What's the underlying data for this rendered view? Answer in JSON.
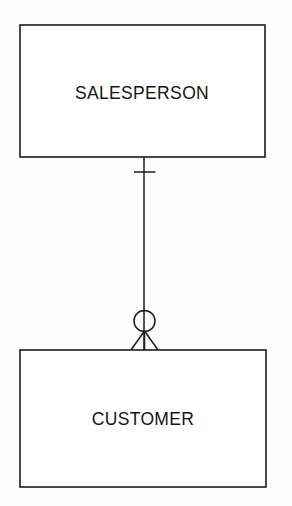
{
  "diagram": {
    "type": "entity-relationship-diagram",
    "notation": "crow's foot",
    "background_color": "#fdfdfd",
    "line_color": "#1c1c1c",
    "text_color": "#141414",
    "entities": [
      {
        "id": "salesperson",
        "label": "SALESPERSON",
        "x": 20,
        "y": 25,
        "width": 245,
        "height": 132,
        "label_x": 142,
        "label_y": 99
      },
      {
        "id": "customer",
        "label": "CUSTOMER",
        "x": 20,
        "y": 350,
        "width": 246,
        "height": 137,
        "label_x": 143,
        "label_y": 425
      }
    ],
    "relationship": {
      "id": "salesperson-customer",
      "from": "salesperson",
      "to": "customer",
      "line_x": 144,
      "line_y1": 157,
      "line_y2": 350,
      "from_cardinality": {
        "label": "one and only one",
        "symbol": "single-tick",
        "tick_y": 172,
        "tick_x1": 134,
        "tick_x2": 155
      },
      "to_cardinality": {
        "label": "zero or many",
        "symbol": "circle-crowsfoot",
        "circle_cx": 144.5,
        "circle_cy": 321,
        "circle_r": 10.5,
        "foot_apex_y": 331,
        "foot_base_y": 350,
        "foot_left_x": 131,
        "foot_right_x": 158
      }
    }
  }
}
